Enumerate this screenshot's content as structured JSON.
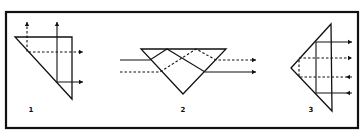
{
  "diagram": {
    "frame": {
      "x": 6,
      "y": 12,
      "width": 352,
      "height": 116,
      "stroke": "#111111"
    },
    "figures": [
      {
        "label": "1",
        "label_pos": [
          31,
          112
        ],
        "prism": [
          [
            15,
            37
          ],
          [
            72,
            37
          ],
          [
            72,
            99
          ]
        ],
        "rays": [
          {
            "style": "dashed",
            "points": [
              [
                27,
                22
              ],
              [
                27,
                52
              ],
              [
                83,
                52
              ]
            ],
            "arrows": [
              "up-start",
              "right-end"
            ]
          },
          {
            "style": "solid",
            "points": [
              [
                57,
                22
              ],
              [
                57,
                82
              ],
              [
                83,
                82
              ]
            ],
            "arrows": [
              "up-start",
              "right-end"
            ]
          }
        ]
      },
      {
        "label": "2",
        "label_pos": [
          183,
          112
        ],
        "prism": [
          [
            141,
            49
          ],
          [
            226,
            49
          ],
          [
            183,
            94
          ]
        ],
        "rays": [
          {
            "style": "solid",
            "points": [
              [
                120,
                60
              ],
              [
                150,
                60
              ],
              [
                167,
                49
              ],
              [
                205,
                72
              ],
              [
                256,
                72
              ]
            ],
            "arrows": [
              "right-end"
            ]
          },
          {
            "style": "dashed",
            "points": [
              [
                120,
                72
              ],
              [
                160,
                72
              ],
              [
                196,
                49
              ],
              [
                216,
                60
              ],
              [
                256,
                60
              ]
            ],
            "arrows": [
              "right-end"
            ]
          }
        ]
      },
      {
        "label": "3",
        "label_pos": [
          311,
          112
        ],
        "prism": [
          [
            291,
            68
          ],
          [
            331,
            24
          ],
          [
            332,
            111
          ]
        ],
        "rays": [
          {
            "style": "solid",
            "points": [
              [
                352,
                93
              ],
              [
                316,
                93
              ],
              [
                316,
                42
              ],
              [
                352,
                42
              ]
            ],
            "arrows": [
              "left-mid",
              "right-end"
            ]
          },
          {
            "style": "dashed",
            "points": [
              [
                352,
                77
              ],
              [
                299,
                77
              ],
              [
                299,
                58
              ],
              [
                352,
                58
              ]
            ],
            "arrows": [
              "left-mid",
              "right-end"
            ]
          }
        ]
      }
    ]
  }
}
